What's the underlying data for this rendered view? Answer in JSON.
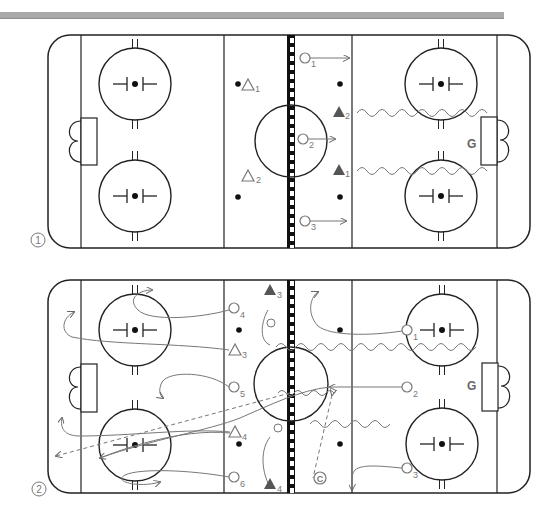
{
  "figure": {
    "type": "hockey-drill-diagram",
    "panels": [
      {
        "number_label": "①",
        "offense": [
          {
            "symbol": "circle",
            "label": "1",
            "x": 305,
            "y": 57
          },
          {
            "symbol": "circle",
            "label": "2",
            "x": 304,
            "y": 141
          },
          {
            "symbol": "circle",
            "label": "3",
            "x": 305,
            "y": 218
          }
        ],
        "defense": [
          {
            "symbol": "triangle-open",
            "label": "1",
            "x": 246,
            "y": 83
          },
          {
            "symbol": "triangle-open",
            "label": "2",
            "x": 248,
            "y": 173
          }
        ],
        "forwards": [
          {
            "symbol": "triangle-filled",
            "label": "2",
            "x": 338,
            "y": 112
          },
          {
            "symbol": "triangle-filled",
            "label": "1",
            "x": 338,
            "y": 170
          }
        ],
        "goalie": {
          "label": "G",
          "x": 472,
          "y": 143
        }
      },
      {
        "number_label": "②",
        "offense": [
          {
            "symbol": "circle",
            "label": "1",
            "x": 407,
            "y": 330
          },
          {
            "symbol": "circle",
            "label": "2",
            "x": 407,
            "y": 387
          },
          {
            "symbol": "circle",
            "label": "3",
            "x": 407,
            "y": 468
          },
          {
            "symbol": "circle",
            "label": "4",
            "x": 234,
            "y": 308
          },
          {
            "symbol": "circle",
            "label": "5",
            "x": 234,
            "y": 387
          },
          {
            "symbol": "circle",
            "label": "6",
            "x": 234,
            "y": 477
          }
        ],
        "defense": [
          {
            "symbol": "triangle-open",
            "label": "3",
            "x": 234,
            "y": 350
          },
          {
            "symbol": "triangle-open",
            "label": "4",
            "x": 234,
            "y": 432
          }
        ],
        "forwards": [
          {
            "symbol": "triangle-filled",
            "label": "3",
            "x": 270,
            "y": 290
          },
          {
            "symbol": "triangle-filled",
            "label": "4",
            "x": 270,
            "y": 484
          }
        ],
        "coach": {
          "label": "C",
          "x": 320,
          "y": 478
        },
        "goalie": {
          "label": "G",
          "x": 473,
          "y": 385
        }
      }
    ]
  },
  "labels": {
    "panel1": "①",
    "panel2": "②",
    "goalie1": "G",
    "goalie2": "G",
    "coach": "C"
  },
  "colors": {
    "line": "#222222",
    "player": "#777777",
    "filled_triangle": "#555555",
    "topbar": "#a9a9a9"
  }
}
